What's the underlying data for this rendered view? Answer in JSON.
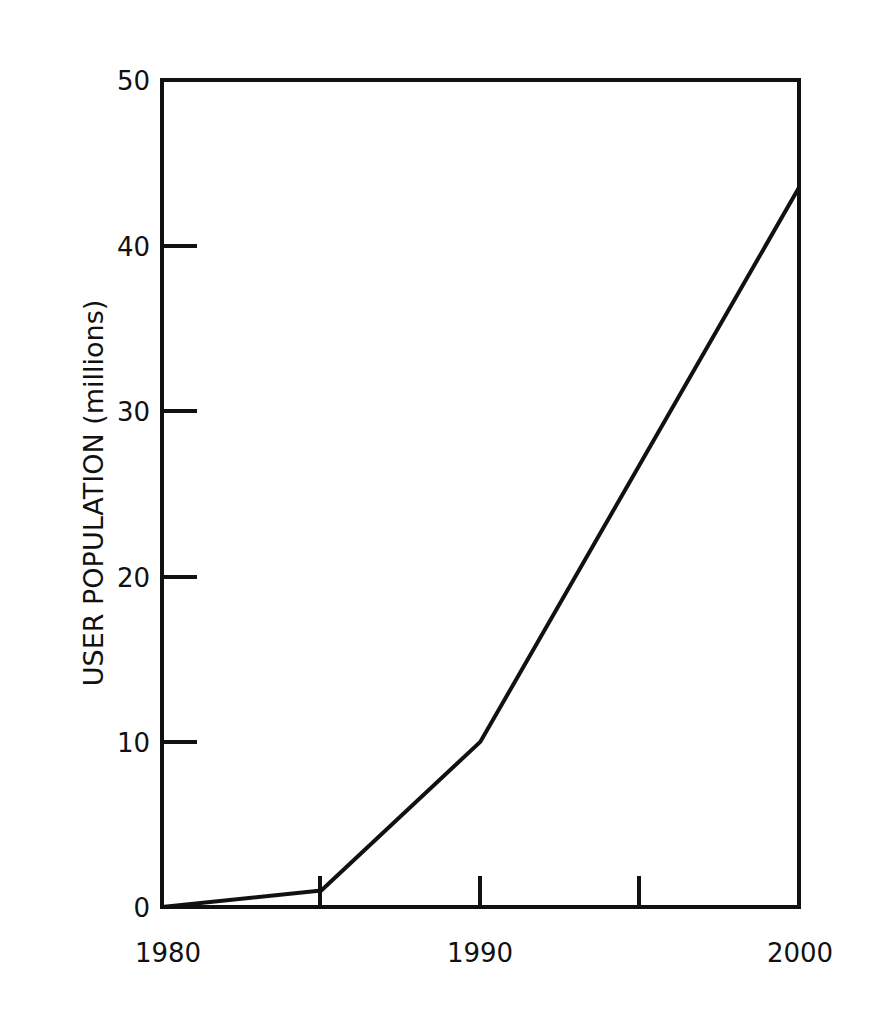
{
  "chart_data": {
    "type": "line",
    "title": "",
    "xlabel": "",
    "ylabel": "USER POPULATION (millions)",
    "x": [
      1980,
      1985,
      1990,
      2000
    ],
    "series": [
      {
        "name": "User population",
        "values": [
          0,
          1,
          10,
          43.5
        ]
      }
    ],
    "xlim": [
      1980,
      2000
    ],
    "ylim": [
      0,
      50
    ],
    "x_ticks": [
      1980,
      1985,
      1990,
      1995,
      2000
    ],
    "x_tick_labels": [
      "1980",
      "1990",
      "2000"
    ],
    "y_ticks": [
      0,
      10,
      20,
      30,
      40,
      50
    ],
    "y_tick_labels": [
      "0",
      "10",
      "20",
      "30",
      "40",
      "50"
    ],
    "grid": false,
    "legend": "none",
    "line_color": "#111111"
  },
  "labels": {
    "ylabel": "USER POPULATION (millions)",
    "y": [
      "0",
      "10",
      "20",
      "30",
      "40",
      "50"
    ],
    "x": [
      "1980",
      "1990",
      "2000"
    ]
  }
}
